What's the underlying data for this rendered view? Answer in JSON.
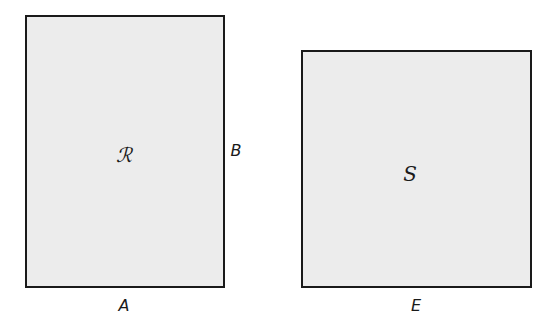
{
  "figures": [
    {
      "id": "R",
      "label": "ℛ",
      "shape": "rectangle",
      "fill": "#ececec",
      "bottom_side_label": "A",
      "right_side_label": "B"
    },
    {
      "id": "S",
      "label": "S",
      "shape": "square",
      "fill": "#ececec",
      "bottom_side_label": "E"
    }
  ]
}
